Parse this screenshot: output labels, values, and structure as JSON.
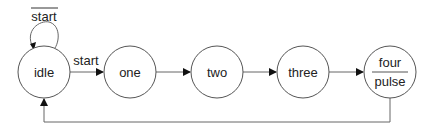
{
  "diagram": {
    "type": "state-machine",
    "states": [
      {
        "id": "idle",
        "label": "idle",
        "cx": 44,
        "cy": 72
      },
      {
        "id": "one",
        "label": "one",
        "cx": 130,
        "cy": 72
      },
      {
        "id": "two",
        "label": "two",
        "cx": 217,
        "cy": 72
      },
      {
        "id": "three",
        "label": "three",
        "cx": 303,
        "cy": 72
      },
      {
        "id": "four",
        "label": "four",
        "output": "pulse",
        "cx": 390,
        "cy": 72
      }
    ],
    "transitions": [
      {
        "from": "idle",
        "to": "idle",
        "label": "start",
        "negated": true
      },
      {
        "from": "idle",
        "to": "one",
        "label": "start"
      },
      {
        "from": "one",
        "to": "two",
        "label": ""
      },
      {
        "from": "two",
        "to": "three",
        "label": ""
      },
      {
        "from": "three",
        "to": "four",
        "label": ""
      },
      {
        "from": "four",
        "to": "idle",
        "label": ""
      }
    ],
    "colors": {
      "stroke": "#555555",
      "text": "#222222",
      "background": "#ffffff"
    }
  }
}
